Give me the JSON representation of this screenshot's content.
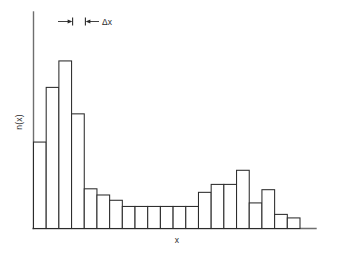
{
  "chart_data": {
    "type": "bar",
    "title": "",
    "subtitle": "",
    "xlabel": "x",
    "ylabel": "n(x)",
    "grid": false,
    "legend": null,
    "legend_position": "none",
    "axis_style": "open-left-bottom",
    "categories": [
      "1",
      "2",
      "3",
      "4",
      "5",
      "6",
      "7",
      "8",
      "9",
      "10",
      "11",
      "12",
      "13",
      "14",
      "15",
      "16",
      "17",
      "18",
      "19",
      "20",
      "21"
    ],
    "values": [
      98,
      160,
      190,
      130,
      45,
      38,
      32,
      25,
      25,
      25,
      25,
      25,
      25,
      41,
      50,
      50,
      66,
      29,
      44,
      16,
      12
    ],
    "bin_width_label": "Δx",
    "bin_count": 21,
    "xlim": [
      0,
      21
    ],
    "ylim": [
      0,
      216
    ],
    "bar_fill_color": "#ffffff",
    "bar_stroke_color": "#2b2b2b",
    "axis_color": "#6e6e6e",
    "annotation": {
      "label": "Δx",
      "marks_bin_index": 3,
      "description": "double-headed arrow spanning one bin width"
    }
  },
  "labels": {
    "y_axis": "n(x)",
    "x_axis": "x",
    "delta_x": "Δx"
  },
  "icons": {
    "arrow_left": "arrow-left-icon",
    "arrow_right": "arrow-right-icon"
  }
}
